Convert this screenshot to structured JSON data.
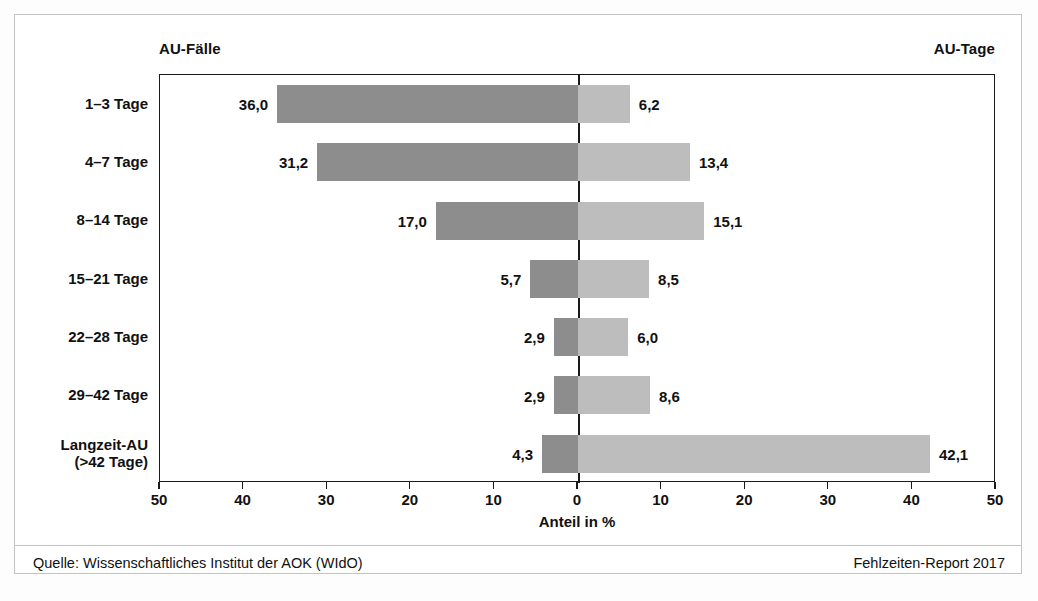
{
  "headers": {
    "left": "AU-Fälle",
    "right": "AU-Tage"
  },
  "axis": {
    "title": "Anteil in %",
    "ticks": [
      "50",
      "40",
      "30",
      "20",
      "10",
      "0",
      "10",
      "20",
      "30",
      "40",
      "50"
    ]
  },
  "footer": {
    "source": "Quelle: Wissenschaftliches Institut der AOK (WIdO)",
    "report": "Fehlzeiten-Report 2017"
  },
  "colors": {
    "bar_left": "#8d8d8d",
    "bar_right": "#bdbdbd",
    "axis": "#1a1a1a",
    "frame": "#c3c3c3"
  },
  "categories": [
    {
      "line1": "1–3 Tage",
      "line2": ""
    },
    {
      "line1": "4–7 Tage",
      "line2": ""
    },
    {
      "line1": "8–14 Tage",
      "line2": ""
    },
    {
      "line1": "15–21 Tage",
      "line2": ""
    },
    {
      "line1": "22–28 Tage",
      "line2": ""
    },
    {
      "line1": "29–42 Tage",
      "line2": ""
    },
    {
      "line1": "Langzeit-AU",
      "line2": "(>42 Tage)"
    }
  ],
  "labels": {
    "left": [
      "36,0",
      "31,2",
      "17,0",
      "5,7",
      "2,9",
      "2,9",
      "4,3"
    ],
    "right": [
      "6,2",
      "13,4",
      "15,1",
      "8,5",
      "6,0",
      "8,6",
      "42,1"
    ]
  },
  "chart_data": {
    "type": "bar",
    "orientation": "horizontal-diverging",
    "title": "",
    "xlabel": "Anteil in %",
    "ylabel": "",
    "xlim": [
      -50,
      50
    ],
    "xticks": [
      -50,
      -40,
      -30,
      -20,
      -10,
      0,
      10,
      20,
      30,
      40,
      50
    ],
    "xticklabels": [
      "50",
      "40",
      "30",
      "20",
      "10",
      "0",
      "10",
      "20",
      "30",
      "40",
      "50"
    ],
    "grid": false,
    "legend": "top-outside",
    "categories": [
      "1–3 Tage",
      "4–7 Tage",
      "8–14 Tage",
      "15–21 Tage",
      "22–28 Tage",
      "29–42 Tage",
      "Langzeit-AU (>42 Tage)"
    ],
    "series": [
      {
        "name": "AU-Fälle",
        "side": "left",
        "color": "#8d8d8d",
        "values": [
          36.0,
          31.2,
          17.0,
          5.7,
          2.9,
          2.9,
          4.3
        ]
      },
      {
        "name": "AU-Tage",
        "side": "right",
        "color": "#bdbdbd",
        "values": [
          6.2,
          13.4,
          15.1,
          8.5,
          6.0,
          8.6,
          42.1
        ]
      }
    ],
    "annotations": {
      "source": "Quelle: Wissenschaftliches Institut der AOK (WIdO)",
      "report": "Fehlzeiten-Report 2017"
    }
  }
}
